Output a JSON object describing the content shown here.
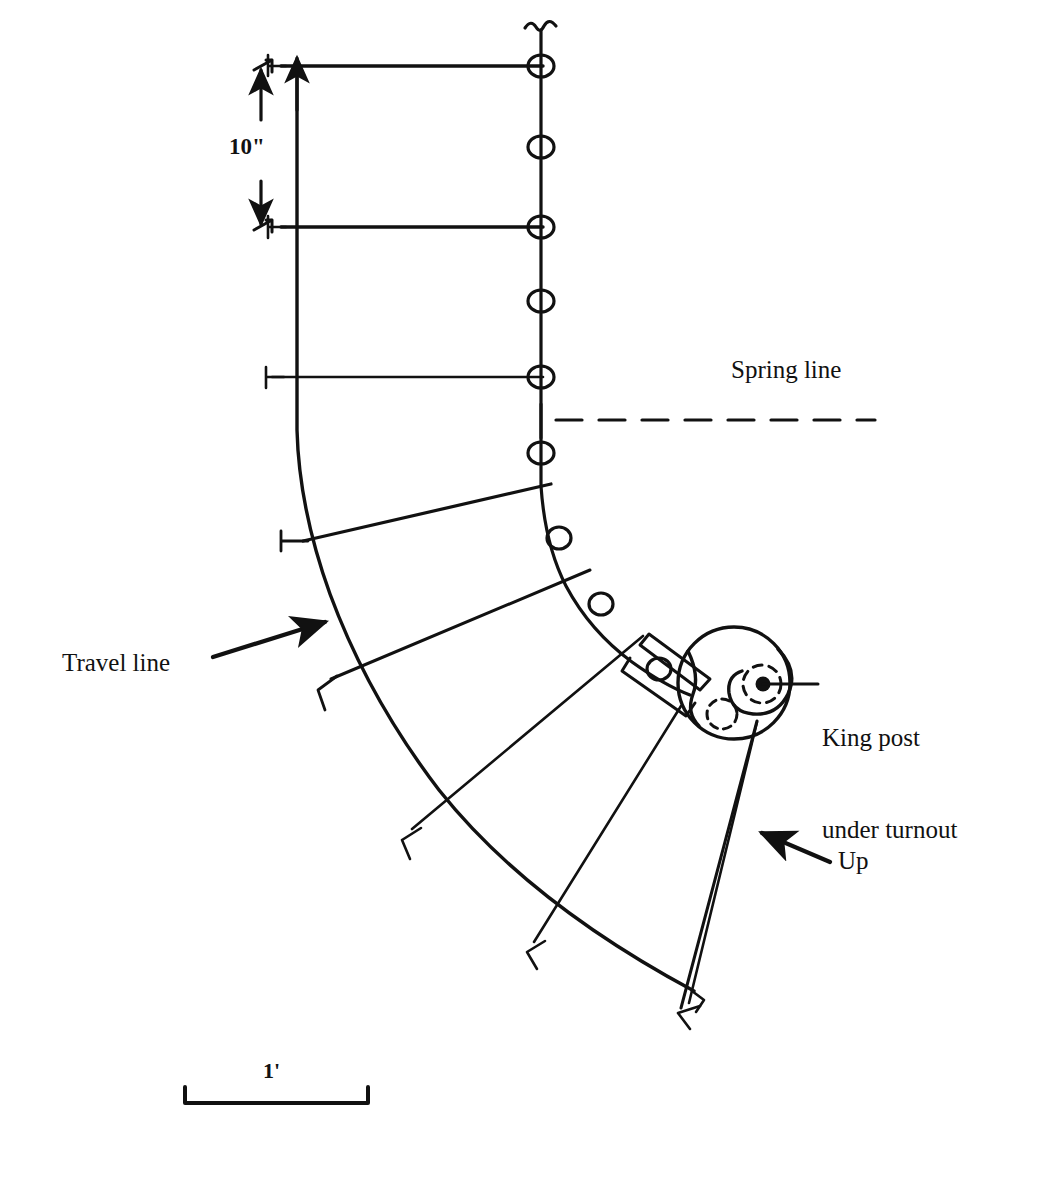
{
  "drawing": {
    "title": "Curved stair plan with volute",
    "type": "architectural-plan",
    "ink_color": "#111111",
    "paper_color": "#ffffff"
  },
  "labels": {
    "spring_line": "Spring line",
    "travel_line": "Travel line",
    "king_post_line1": "King post",
    "king_post_line2": "under turnout",
    "up": "Up"
  },
  "dimensions": {
    "tread_rise_label": "10\"",
    "scale_bar_label": "1'"
  },
  "icons": {
    "break_symbol": "break-symbol-icon",
    "baluster": "baluster-circle-icon",
    "arrow_up": "arrow-up-icon",
    "arrow_down": "arrow-down-icon",
    "arrow_pointer": "arrow-pointer-icon",
    "king_post_dot": "king-post-dot-icon",
    "dashed_circle": "dashed-circle-icon",
    "tick_mark": "tick-mark-icon"
  },
  "geometry": {
    "inner_stringer_path": "M 541 30 L 541 486 Q 545 545 566 586 Q 590 631 632 662 Q 663 684 689 694",
    "travel_line_path": "M 297 62 L 297 430 Q 300 516 333 601 Q 372 700 441 789 Q 530 901 694 990",
    "outer_down_path": "M 755 723 L 679 1006",
    "spring_line_y": 420,
    "spring_line_x_start": 556,
    "spring_line_x_end": 875,
    "balusters": [
      {
        "cx": 541,
        "cy": 66,
        "r": 11
      },
      {
        "cx": 541,
        "cy": 146,
        "r": 11
      },
      {
        "cx": 541,
        "cy": 227,
        "r": 11
      },
      {
        "cx": 541,
        "cy": 301,
        "r": 11
      },
      {
        "cx": 541,
        "cy": 377,
        "r": 11
      },
      {
        "cx": 541,
        "cy": 453,
        "r": 11
      },
      {
        "cx": 559,
        "cy": 538,
        "r": 11
      },
      {
        "cx": 600,
        "cy": 604,
        "r": 11
      },
      {
        "cx": 659,
        "cy": 669,
        "r": 11
      }
    ],
    "straight_treads": [
      {
        "x1": 281,
        "y1": 66,
        "x2": 541,
        "y2": 66
      },
      {
        "x1": 281,
        "y1": 227,
        "x2": 541,
        "y2": 227
      },
      {
        "x1": 272,
        "y1": 377,
        "x2": 541,
        "y2": 377
      }
    ],
    "winder_treads": [
      {
        "x1": 303,
        "y1": 541,
        "x2": 551,
        "y2": 484
      },
      {
        "x1": 331,
        "y1": 679,
        "x2": 589,
        "y2": 570
      },
      {
        "x1": 412,
        "y1": 828,
        "x2": 641,
        "y2": 637
      },
      {
        "x1": 534,
        "y1": 941,
        "x2": 679,
        "y2": 706
      },
      {
        "x1": 688,
        "y1": 1002,
        "x2": 755,
        "y2": 723
      }
    ],
    "tick_marks": [
      {
        "x": 281,
        "y": 66
      },
      {
        "x": 281,
        "y": 227
      },
      {
        "x": 272,
        "y": 377
      },
      {
        "x": 303,
        "y": 541
      },
      {
        "x": 331,
        "y": 679
      },
      {
        "x": 412,
        "y": 828
      },
      {
        "x": 534,
        "y": 941
      },
      {
        "x": 688,
        "y": 1002
      }
    ],
    "volute": {
      "outer_cx": 734,
      "outer_cy": 683,
      "outer_r": 56,
      "king_post_cx": 763,
      "king_post_cy": 684,
      "king_post_r": 7,
      "dashed_inner_r": 19,
      "dashed_lower_cx": 722,
      "dashed_lower_cy": 714,
      "dashed_lower_r": 15
    },
    "scale_bar": {
      "x1": 185,
      "x2": 368,
      "y": 1103,
      "tick_height": 16
    }
  }
}
